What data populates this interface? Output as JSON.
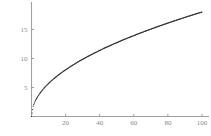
{
  "figure": {
    "name": "square-root-curve-plot",
    "background_color": "#ffffff",
    "axis_color": "#a0a0a0",
    "curve_color": "#2b2b2b",
    "tick_label_color": "#8a8a8a"
  },
  "chart_data": {
    "type": "scatter",
    "title": "",
    "subtitle": "",
    "xlabel": "",
    "ylabel": "",
    "xlim": [
      0,
      105
    ],
    "ylim": [
      0,
      19
    ],
    "grid": false,
    "legend": null,
    "legend_position": "none",
    "marker": "dot",
    "marker_size": 1.1,
    "line_style": "dotted",
    "x_ticks": [
      20,
      40,
      60,
      80,
      100
    ],
    "x_tick_labels": [
      "20",
      "40",
      "60",
      "80",
      "100"
    ],
    "y_ticks": [
      5,
      10,
      15
    ],
    "y_tick_labels": [
      "5",
      "10",
      "15"
    ],
    "series": [
      {
        "name": "y = 1.8 sqrt(x)",
        "x": [
          0,
          1,
          2,
          3,
          4,
          5,
          6,
          7,
          8,
          9,
          10,
          12,
          14,
          16,
          18,
          20,
          22,
          24,
          26,
          28,
          30,
          33,
          36,
          39,
          42,
          45,
          48,
          51,
          54,
          57,
          60,
          64,
          68,
          72,
          76,
          80,
          84,
          88,
          92,
          96,
          100
        ],
        "y": [
          0,
          1.8,
          2.55,
          3.12,
          3.6,
          4.02,
          4.41,
          4.76,
          5.09,
          5.4,
          5.69,
          6.24,
          6.73,
          7.2,
          7.64,
          8.05,
          8.44,
          8.82,
          9.18,
          9.53,
          9.86,
          10.34,
          10.8,
          11.24,
          11.67,
          12.07,
          12.47,
          12.85,
          13.23,
          13.59,
          13.94,
          14.4,
          14.84,
          15.27,
          15.69,
          16.1,
          16.5,
          16.88,
          17.27,
          17.64,
          18.0
        ]
      }
    ]
  }
}
